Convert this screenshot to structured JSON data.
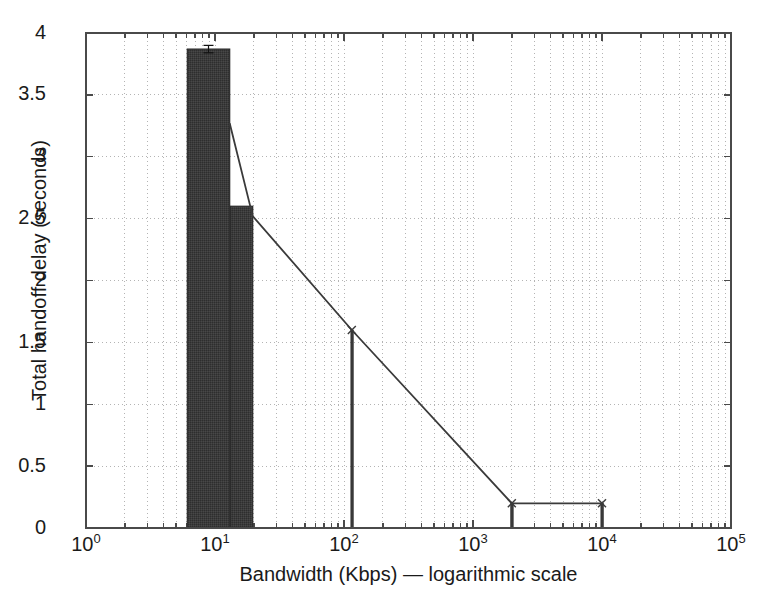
{
  "chart_data": {
    "type": "bar",
    "title": "",
    "xlabel": "Bandwidth (Kbps) — logarithmic scale",
    "ylabel": "Total handoff delay (seconds)",
    "xscale": "log",
    "xlim": [
      1,
      100000
    ],
    "ylim": [
      0,
      4
    ],
    "grid": true,
    "legend": null,
    "x_tick_labels": [
      "10",
      "10",
      "10",
      "10",
      "10",
      "10"
    ],
    "x_tick_exponents": [
      "0",
      "1",
      "2",
      "3",
      "4",
      "5"
    ],
    "x_tick_values": [
      1,
      10,
      100,
      1000,
      10000,
      100000
    ],
    "y_tick_labels": [
      "0",
      "0.5",
      "1",
      "1.5",
      "2",
      "2.5",
      "3",
      "3.5",
      "4"
    ],
    "y_tick_values": [
      0,
      0.5,
      1,
      1.5,
      2,
      2.5,
      3,
      3.5,
      4
    ],
    "x": [
      9.6,
      16.5,
      115,
      2000,
      10000
    ],
    "values": [
      3.87,
      2.6,
      1.6,
      0.2,
      0.2
    ],
    "bar_left_edges": [
      6.1,
      13.2,
      113,
      1960,
      9800
    ],
    "bar_right_edges": [
      13.0,
      19.6,
      118,
      2050,
      10250
    ],
    "error_bars": [
      0.03,
      0.0,
      0.0,
      0.0,
      0.0
    ],
    "line_series": {
      "name": "connected trend",
      "x": [
        9.6,
        16.5,
        115,
        2000,
        10000
      ],
      "y": [
        3.27,
        2.52,
        1.6,
        0.2,
        0.2
      ]
    },
    "bar_color": "#3a3a3a",
    "line_color": "#3a3a3a",
    "grid_color": "#b4b4b4",
    "axis_color": "#4a4a4a",
    "background_color": "#ffffff"
  }
}
